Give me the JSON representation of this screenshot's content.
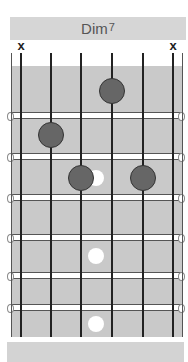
{
  "chord": {
    "name": "Dim",
    "superscript": "7",
    "title_full": "Dim7"
  },
  "diagram": {
    "strings": 6,
    "frets_shown": 6,
    "muted_strings": [
      1,
      6
    ],
    "muted_symbol": "x",
    "fingered_notes": [
      {
        "string": 4,
        "fret": 1
      },
      {
        "string": 2,
        "fret": 2
      },
      {
        "string": 3,
        "fret": 3
      },
      {
        "string": 5,
        "fret": 3
      }
    ],
    "inlay_frets": [
      3,
      5,
      7
    ],
    "colors": {
      "header_bg": "#d6d6d6",
      "fretboard_bg": "#c9c9c9",
      "dot_fill": "#666666",
      "inlay_fill": "#ffffff",
      "string_color": "#222222",
      "text_color": "#555555"
    }
  }
}
